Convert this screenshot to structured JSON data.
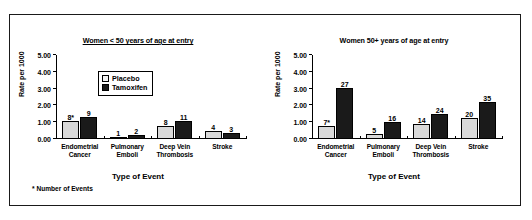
{
  "figure": {
    "footnote": "* Number of Events"
  },
  "legend": {
    "placebo_label": "Placebo",
    "tamoxifen_label": "Tamoxifen",
    "placebo_color": "#d9d9d9",
    "tamoxifen_color": "#1a1a1a"
  },
  "axis": {
    "ylabel": "Rate per 1000",
    "xlabel": "Type of Event",
    "yticks": [
      "0.00",
      "1.00",
      "2.00",
      "3.00",
      "4.00",
      "5.00"
    ]
  },
  "chart_data": [
    {
      "type": "bar",
      "title": "Women < 50 years of age at entry",
      "xlabel": "Type of Event",
      "ylabel": "Rate per 1000",
      "ylim": [
        0,
        5
      ],
      "yticks": [
        0,
        1,
        2,
        3,
        4,
        5
      ],
      "grid": false,
      "legend_position": "upper-left-inside",
      "categories": [
        "Endometrial Cancer",
        "Pulmonary Emboli",
        "Deep Vein Thrombosis",
        "Stroke"
      ],
      "category_lines": [
        [
          "Endometrial",
          "Cancer"
        ],
        [
          "Pulmonary",
          "Emboli"
        ],
        [
          "Deep Vein",
          "Thrombosis"
        ],
        [
          "Stroke"
        ]
      ],
      "series": [
        {
          "name": "Placebo",
          "values": [
            1.05,
            0.04,
            0.78,
            0.45
          ],
          "point_labels": [
            "8*",
            "1",
            "8",
            "4"
          ]
        },
        {
          "name": "Tamoxifen",
          "values": [
            1.3,
            0.22,
            1.1,
            0.35
          ],
          "point_labels": [
            "9",
            "2",
            "11",
            "3"
          ]
        }
      ]
    },
    {
      "type": "bar",
      "title": "Women 50+ years of age at entry",
      "xlabel": "Type of Event",
      "ylabel": "Rate per 1000",
      "ylim": [
        0,
        5
      ],
      "yticks": [
        0,
        1,
        2,
        3,
        4,
        5
      ],
      "grid": false,
      "legend_position": "none",
      "categories": [
        "Endometrial Cancer",
        "Pulmonary Emboli",
        "Deep Vein Thrombosis",
        "Stroke"
      ],
      "category_lines": [
        [
          "Endometrial",
          "Cancer"
        ],
        [
          "Pulmonary",
          "Emboli"
        ],
        [
          "Deep Vein",
          "Thrombosis"
        ],
        [
          "Stroke"
        ]
      ],
      "series": [
        {
          "name": "Placebo",
          "values": [
            0.76,
            0.32,
            0.88,
            1.25
          ],
          "point_labels": [
            "7*",
            "5",
            "14",
            "20"
          ]
        },
        {
          "name": "Tamoxifen",
          "values": [
            3.05,
            1.0,
            1.5,
            2.2
          ],
          "point_labels": [
            "27",
            "16",
            "24",
            "35"
          ]
        }
      ]
    }
  ]
}
